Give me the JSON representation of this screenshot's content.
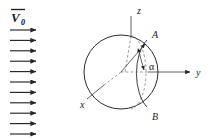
{
  "figure": {
    "background_color": "#ffffff",
    "line_color": "#2b2b2b",
    "dashed_color": "#7d7d7d"
  },
  "flow": {
    "label_main": "V",
    "label_subscript": "0",
    "label_full": "V0",
    "vector_bar": true,
    "arrow_count": 11,
    "arrow_x_start": 10,
    "arrow_x_end": 41,
    "arrow_y_first": 30,
    "arrow_spacing": 10.4,
    "direction": "right"
  },
  "axes": [
    {
      "name": "z-axis",
      "label": "z",
      "direction": "up",
      "label_x": 137,
      "label_y": 14
    },
    {
      "name": "y-axis",
      "label": "y",
      "direction": "right",
      "label_x": 196,
      "label_y": 74
    },
    {
      "name": "x-axis",
      "label": "x",
      "direction": "down-left",
      "label_x": 80,
      "label_y": 106
    }
  ],
  "sphere": {
    "center_x": 121,
    "center_y": 72,
    "radius": 37,
    "meridian_arc_solid": true,
    "meridian_ellipse_dashed": true
  },
  "points": [
    {
      "name": "point-a",
      "label": "A",
      "x": 152,
      "y": 37,
      "marker_x": 146,
      "marker_y": 44
    },
    {
      "name": "point-b",
      "label": "B",
      "x": 152,
      "y": 116,
      "marker_x": 146,
      "marker_y": 108
    }
  ],
  "angle": {
    "name": "alpha-angle",
    "label": "α",
    "label_x": 152,
    "label_y": 69,
    "vertex_x": 121,
    "vertex_y": 72,
    "arc_radius": 22,
    "double_headed_arrow": true
  }
}
